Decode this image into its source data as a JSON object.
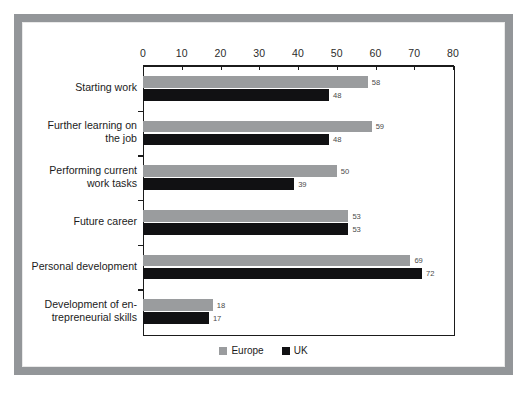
{
  "chart_data": {
    "type": "bar",
    "orientation": "horizontal",
    "title": "",
    "xlabel": "",
    "ylabel": "",
    "xlim": [
      0,
      80
    ],
    "xticks": [
      0,
      10,
      20,
      30,
      40,
      50,
      60,
      70,
      80
    ],
    "grid": false,
    "legend_position": "bottom-center",
    "categories": [
      "Starting work",
      "Further learning on the job",
      "Performing current work tasks",
      "Future career",
      "Personal development",
      "Development of entrepreneurial skills"
    ],
    "category_lines": [
      [
        "Starting work"
      ],
      [
        "Further learning on",
        "the job"
      ],
      [
        "Performing current",
        "work tasks"
      ],
      [
        "Future career"
      ],
      [
        "Personal development"
      ],
      [
        "Development of en-",
        "trepreneurial skills"
      ]
    ],
    "series": [
      {
        "name": "Europe",
        "color": "#9a9c9e",
        "values": [
          58,
          59,
          50,
          53,
          69,
          18
        ]
      },
      {
        "name": "UK",
        "color": "#111113",
        "values": [
          48,
          48,
          39,
          53,
          72,
          17
        ]
      }
    ]
  },
  "legend": {
    "items": [
      {
        "label": "Europe",
        "color": "#9a9c9e"
      },
      {
        "label": "UK",
        "color": "#111113"
      }
    ]
  },
  "colors": {
    "frame": "#939699",
    "axis": "#1b1b1b",
    "europe": "#9a9c9e",
    "uk": "#111113",
    "value_label": "#4a4a4a",
    "background": "#ffffff"
  }
}
